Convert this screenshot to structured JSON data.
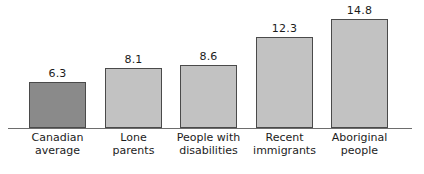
{
  "chart_data": {
    "type": "bar",
    "title": "",
    "subtitle": "",
    "xlabel": "",
    "ylabel": "",
    "ylim": [
      0,
      16
    ],
    "grid": false,
    "legend": "none",
    "categories": [
      "Canadian average",
      "Lone parents",
      "People with disabilities",
      "Recent immigrants",
      "Aboriginal people"
    ],
    "category_lines": [
      [
        "Canadian",
        "average"
      ],
      [
        "Lone",
        "parents"
      ],
      [
        "People with",
        "disabilities"
      ],
      [
        "Recent",
        "immigrants"
      ],
      [
        "Aboriginal",
        "people"
      ]
    ],
    "values": [
      6.3,
      8.1,
      8.6,
      12.3,
      14.8
    ],
    "value_labels": [
      "6.3",
      "8.1",
      "8.6",
      "12.3",
      "14.8"
    ],
    "bar_colors": [
      "#8a8a8a",
      "#c2c2c2",
      "#c2c2c2",
      "#c2c2c2",
      "#c2c2c2"
    ],
    "bar_border_color": "#4a4a4a",
    "axis_color": "#6d6d6d",
    "text_color": "#1c1c1c",
    "background": "#ffffff"
  },
  "axis": {
    "baseline_label": "category-axis"
  }
}
